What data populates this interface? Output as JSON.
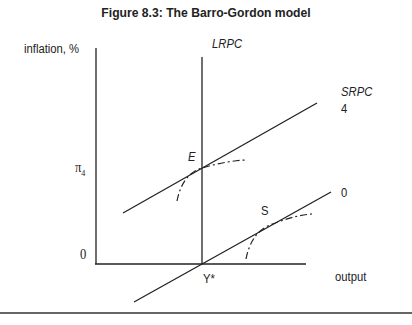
{
  "title": "Figure 8.3: The Barro-Gordon model",
  "axes": {
    "y_label": "inflation, %",
    "x_label": "output",
    "origin_label": "0",
    "y_tick_label": "π",
    "y_tick_subscript": "4",
    "x_tick_label": "Y*"
  },
  "curves": {
    "lrpc_label": "LRPC",
    "srpc_label": "SRPC",
    "srpc_upper_label": "4",
    "srpc_lower_label": "0"
  },
  "points": {
    "equilibrium_label": "E",
    "optimum_label": "S"
  },
  "colors": {
    "line": "#222222",
    "background": "#ffffff"
  }
}
